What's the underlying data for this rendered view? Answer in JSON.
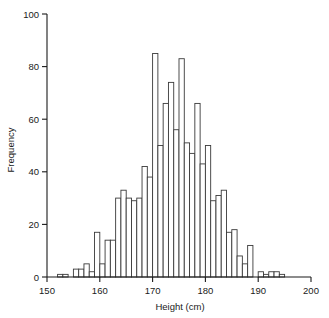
{
  "chart_data": {
    "type": "bar",
    "title": "",
    "xlabel": "Height (cm)",
    "ylabel": "Frequency",
    "xlim": [
      150,
      200
    ],
    "ylim": [
      0,
      100
    ],
    "grid": false,
    "legend": null,
    "xticks": [
      150,
      160,
      170,
      180,
      190,
      200
    ],
    "yticks": [
      0,
      20,
      40,
      60,
      80,
      100
    ],
    "bin_width": 1,
    "bin_starts": [
      152,
      153,
      154,
      155,
      156,
      157,
      158,
      159,
      160,
      161,
      162,
      163,
      164,
      165,
      166,
      167,
      168,
      169,
      170,
      171,
      172,
      173,
      174,
      175,
      176,
      177,
      178,
      179,
      180,
      181,
      182,
      183,
      184,
      185,
      186,
      187,
      188,
      189,
      190,
      191,
      192,
      193,
      194
    ],
    "categories": [
      "152",
      "153",
      "154",
      "155",
      "156",
      "157",
      "158",
      "159",
      "160",
      "161",
      "162",
      "163",
      "164",
      "165",
      "166",
      "167",
      "168",
      "169",
      "170",
      "171",
      "172",
      "173",
      "174",
      "175",
      "176",
      "177",
      "178",
      "179",
      "180",
      "181",
      "182",
      "183",
      "184",
      "185",
      "186",
      "187",
      "188",
      "189",
      "190",
      "191",
      "192",
      "193",
      "194"
    ],
    "values": [
      1,
      1,
      0,
      3,
      3,
      5,
      2,
      17,
      5,
      14,
      14,
      30,
      33,
      30,
      29,
      30,
      42,
      38,
      85,
      50,
      66,
      74,
      56,
      83,
      51,
      47,
      66,
      43,
      50,
      29,
      31,
      33,
      17,
      18,
      8,
      5,
      12,
      0,
      2,
      1,
      2,
      2,
      1
    ]
  },
  "axes": {
    "x_title": "Height (cm)",
    "y_title": "Frequency",
    "x_tick_labels": [
      "150",
      "160",
      "170",
      "180",
      "190",
      "200"
    ],
    "y_tick_labels": [
      "0",
      "20",
      "40",
      "60",
      "80",
      "100"
    ]
  },
  "colors": {
    "bar_stroke": "#3a3a3a",
    "bar_fill": "#ffffff",
    "axis": "#1a1a1a",
    "background": "#ffffff"
  }
}
